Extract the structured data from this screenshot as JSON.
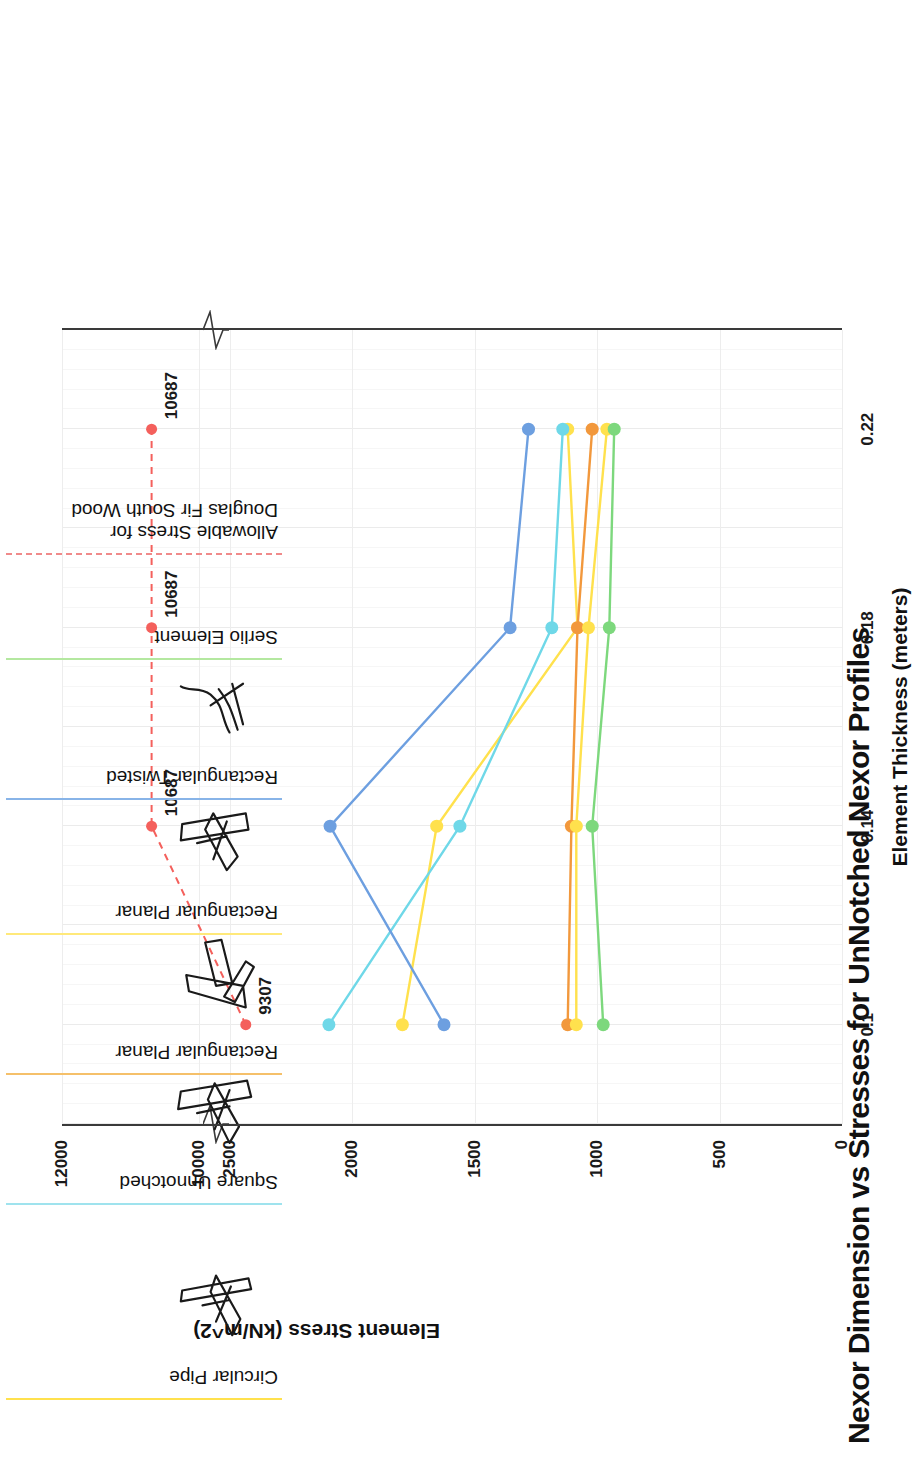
{
  "chart_data": {
    "type": "line",
    "title": "Nexor Dimension vs Stresses for UnNotched Nexor Profiles",
    "xlabel": "Element Thickness (meters)",
    "ylabel": "Element Stress (kN/m^2)",
    "orientation": "rotated-90-ccw",
    "grid": true,
    "legend_position": "right",
    "x": [
      0.1,
      0.14,
      0.18,
      0.22
    ],
    "xticks": [
      "0.1",
      "0.14",
      "0.18",
      "0.22"
    ],
    "xlim": [
      0.08,
      0.24
    ],
    "yticks": [
      "0",
      "500",
      "1000",
      "1500",
      "2000",
      "2500",
      "10000",
      "12000"
    ],
    "ylim": [
      0,
      12000
    ],
    "y_axis_break": {
      "present": true,
      "between": [
        2500,
        10000
      ],
      "label": "axis-break"
    },
    "series": [
      {
        "name": "Circular Pipe",
        "color": "#ffe14d",
        "values": [
          1795,
          1655,
          1080,
          1120
        ]
      },
      {
        "name": "Square Unnotched",
        "color": "#6fd8e8",
        "values": [
          2095,
          1560,
          1185,
          1140
        ]
      },
      {
        "name": "Rectangular Planar",
        "color": "#f2983c",
        "values": [
          1120,
          1105,
          1080,
          1020
        ]
      },
      {
        "name": "Rectangular Planar",
        "color": "#ffe14d",
        "values": [
          1085,
          1085,
          1035,
          960
        ]
      },
      {
        "name": "Rectangular Twisted",
        "color": "#6d9fe0",
        "values": [
          1625,
          2090,
          1355,
          1280
        ]
      },
      {
        "name": "Serlio Element",
        "color": "#7dd87d",
        "values": [
          975,
          1020,
          950,
          930
        ]
      },
      {
        "name": "Allowable Stress for Douglas Fir South Wood",
        "color": "#f4605c",
        "style": "dashed",
        "values": [
          9307,
          10687,
          10687,
          10687
        ],
        "point_labels": [
          "9307",
          "10687",
          "10687",
          "10687"
        ]
      }
    ]
  },
  "legend": {
    "entries": [
      {
        "label": "Circular Pipe",
        "color": "#ffe14d",
        "style": "solid",
        "icon": "nexor-circular-pipe-icon"
      },
      {
        "label": "Square Unnotched",
        "color": "#9fe3ee",
        "style": "solid",
        "icon": "nexor-square-unnotched-icon"
      },
      {
        "label": "Rectangular Planar",
        "color": "#f5c06a",
        "style": "solid",
        "icon": "nexor-rectangular-planar-a-icon"
      },
      {
        "label": "Rectangular Planar",
        "color": "#ffe97a",
        "style": "solid",
        "icon": "nexor-rectangular-planar-b-icon"
      },
      {
        "label": "Rectangular Twisted",
        "color": "#88b4e8",
        "style": "solid",
        "icon": "nexor-rectangular-twisted-icon"
      },
      {
        "label": "Serlio Element",
        "color": "#b4e8a0",
        "style": "solid",
        "icon": "nexor-serlio-element-icon"
      },
      {
        "label": "Allowable Stress for\nDouglas Fir South Wood",
        "color": "#f08a8a",
        "style": "dashed",
        "icon": "none"
      }
    ]
  },
  "axes": {
    "stress_title": "Element Stress (kN/m^2)",
    "thickness_title": "Element Thickness (meters)",
    "stress_ticks": [
      "12000",
      "10000",
      "2500",
      "2000",
      "1500",
      "1000",
      "500",
      "0"
    ],
    "thickness_ticks": [
      "0.1",
      "0.14",
      "0.18",
      "0.22"
    ]
  }
}
